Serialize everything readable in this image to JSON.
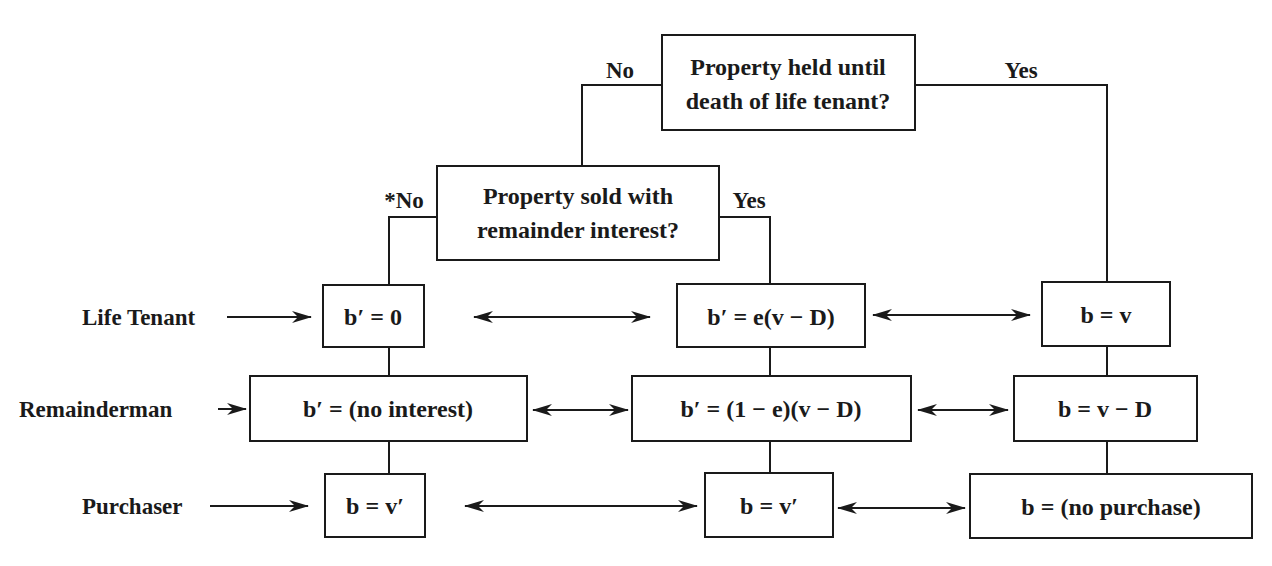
{
  "diagram": {
    "decisions": {
      "top": {
        "line1": "Property held until",
        "line2": "death of life tenant?",
        "no_label": "No",
        "yes_label": "Yes"
      },
      "middle": {
        "line1": "Property sold with",
        "line2": "remainder interest?",
        "no_label": "*No",
        "yes_label": "Yes"
      }
    },
    "row_labels": {
      "life_tenant": "Life Tenant",
      "remainderman": "Remainderman",
      "purchaser": "Purchaser"
    },
    "outcomes": {
      "no_sale": {
        "life_tenant": "b′ = 0",
        "remainderman": "b′ = (no interest)",
        "purchaser": "b = v′"
      },
      "sold_with_remainder": {
        "life_tenant": "b′ = e(v − D)",
        "remainderman": "b′ = (1 − e)(v − D)",
        "purchaser": "b = v′"
      },
      "held_until_death": {
        "life_tenant": "b = v",
        "remainderman": "b = v − D",
        "purchaser": "b = (no purchase)"
      }
    },
    "colors": {
      "ink": "#1a1a1a",
      "background": "#ffffff"
    }
  }
}
